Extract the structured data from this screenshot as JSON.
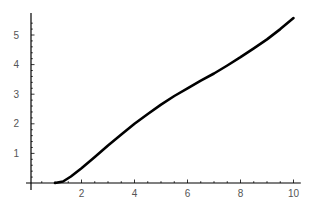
{
  "chart_data": {
    "type": "line",
    "title": "",
    "xlabel": "",
    "ylabel": "",
    "xlim": [
      0.1,
      10.2
    ],
    "ylim": [
      0,
      5.6
    ],
    "grid": false,
    "legend": null,
    "x_ticks": [
      2,
      4,
      6,
      8,
      10
    ],
    "y_ticks": [
      1,
      2,
      3,
      4,
      5
    ],
    "series": [
      {
        "name": "curve",
        "color": "#000000",
        "x": [
          1.0,
          1.3,
          1.6,
          2.0,
          2.5,
          3.0,
          3.5,
          4.0,
          4.5,
          5.0,
          5.5,
          6.0,
          6.5,
          7.0,
          7.5,
          8.0,
          8.5,
          9.0,
          9.5,
          10.0
        ],
        "y": [
          0.0,
          0.05,
          0.22,
          0.5,
          0.88,
          1.27,
          1.64,
          2.0,
          2.33,
          2.65,
          2.94,
          3.2,
          3.46,
          3.7,
          3.97,
          4.25,
          4.55,
          4.85,
          5.2,
          5.57
        ]
      }
    ]
  },
  "axes": {
    "color": "#000000",
    "label_color": "#555555"
  }
}
